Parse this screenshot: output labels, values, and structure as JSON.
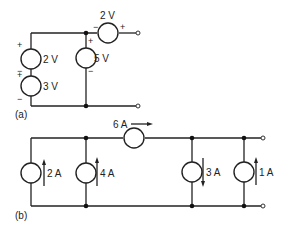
{
  "circuit_a": {
    "label": "(a)",
    "sources": [
      {
        "name": "left-top",
        "value": "2 V",
        "plus": "+",
        "minus": "−"
      },
      {
        "name": "left-bottom",
        "value": "3 V",
        "plus": "+",
        "minus": "−"
      },
      {
        "name": "middle",
        "value": "5 V",
        "plus": "+",
        "minus": "−"
      },
      {
        "name": "series-top",
        "value": "2 V",
        "plus": "+",
        "minus": "−"
      }
    ]
  },
  "circuit_b": {
    "label": "(b)",
    "sources": [
      {
        "name": "branch-1",
        "value": "2 A",
        "direction": "up"
      },
      {
        "name": "branch-2",
        "value": "4 A",
        "direction": "up"
      },
      {
        "name": "series-top",
        "value": "6 A",
        "direction": "right"
      },
      {
        "name": "branch-3",
        "value": "3 A",
        "direction": "down"
      },
      {
        "name": "branch-4",
        "value": "1 A",
        "direction": "up"
      }
    ]
  }
}
